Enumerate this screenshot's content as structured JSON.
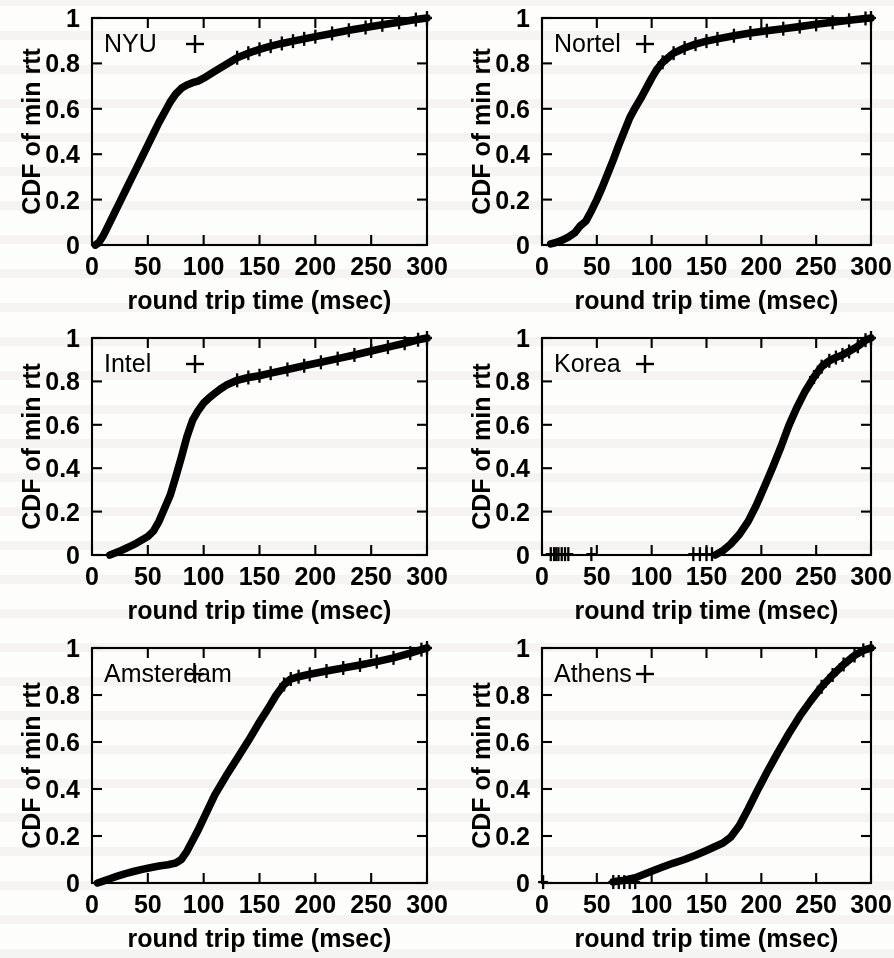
{
  "figure": {
    "panel_count": 6,
    "xlabel": "round trip time (msec)",
    "ylabel": "CDF of min rtt",
    "key_marker": "+"
  },
  "axes": {
    "x_ticks": [
      "0",
      "50",
      "100",
      "150",
      "200",
      "250",
      "300"
    ],
    "y_ticks": [
      "0",
      "0.2",
      "0.4",
      "0.6",
      "0.8",
      "1"
    ]
  },
  "chart_data": [
    {
      "type": "line",
      "title": "NYU",
      "xlabel": "round trip time (msec)",
      "ylabel": "CDF of min rtt",
      "xlim": [
        0,
        300
      ],
      "ylim": [
        0,
        1
      ],
      "grid": false,
      "legend": "NYU",
      "legend_position": "top-left-inside",
      "marker": "+",
      "x": [
        3,
        6,
        10,
        15,
        20,
        25,
        30,
        35,
        40,
        45,
        50,
        55,
        60,
        65,
        70,
        75,
        80,
        85,
        90,
        95,
        100,
        110,
        120,
        130,
        140,
        150,
        160,
        170,
        180,
        190,
        200,
        215,
        230,
        245,
        260,
        275,
        290,
        300
      ],
      "y": [
        0.0,
        0.01,
        0.04,
        0.09,
        0.14,
        0.19,
        0.24,
        0.29,
        0.34,
        0.39,
        0.44,
        0.49,
        0.54,
        0.585,
        0.63,
        0.665,
        0.69,
        0.705,
        0.715,
        0.722,
        0.735,
        0.765,
        0.795,
        0.825,
        0.845,
        0.862,
        0.876,
        0.888,
        0.898,
        0.908,
        0.918,
        0.932,
        0.946,
        0.958,
        0.97,
        0.981,
        0.993,
        1.0
      ]
    },
    {
      "type": "line",
      "title": "Nortel",
      "xlabel": "round trip time (msec)",
      "ylabel": "CDF of min rtt",
      "xlim": [
        0,
        300
      ],
      "ylim": [
        0,
        1
      ],
      "grid": false,
      "legend": "Nortel",
      "legend_position": "top-left-inside",
      "marker": "+",
      "x": [
        8,
        12,
        18,
        24,
        30,
        35,
        40,
        45,
        50,
        55,
        60,
        65,
        70,
        75,
        80,
        85,
        90,
        95,
        100,
        105,
        110,
        120,
        130,
        140,
        150,
        160,
        175,
        190,
        205,
        220,
        235,
        250,
        265,
        280,
        295,
        300
      ],
      "y": [
        0.005,
        0.01,
        0.02,
        0.035,
        0.055,
        0.085,
        0.105,
        0.15,
        0.2,
        0.255,
        0.315,
        0.375,
        0.44,
        0.5,
        0.56,
        0.605,
        0.645,
        0.69,
        0.735,
        0.775,
        0.805,
        0.845,
        0.868,
        0.885,
        0.898,
        0.908,
        0.922,
        0.934,
        0.944,
        0.953,
        0.962,
        0.972,
        0.981,
        0.99,
        0.998,
        1.0
      ]
    },
    {
      "type": "line",
      "title": "Intel",
      "xlabel": "round trip time (msec)",
      "ylabel": "CDF of min rtt",
      "xlim": [
        0,
        300
      ],
      "ylim": [
        0,
        1
      ],
      "grid": false,
      "legend": "Intel",
      "legend_position": "top-left-inside",
      "marker": "+",
      "x": [
        16,
        20,
        25,
        30,
        35,
        40,
        45,
        50,
        55,
        60,
        65,
        70,
        75,
        80,
        85,
        90,
        95,
        100,
        105,
        110,
        115,
        120,
        130,
        140,
        150,
        160,
        175,
        190,
        205,
        220,
        235,
        250,
        265,
        280,
        292,
        300
      ],
      "y": [
        0.0,
        0.008,
        0.018,
        0.03,
        0.042,
        0.055,
        0.07,
        0.085,
        0.11,
        0.155,
        0.215,
        0.275,
        0.36,
        0.45,
        0.545,
        0.62,
        0.665,
        0.7,
        0.725,
        0.745,
        0.765,
        0.782,
        0.805,
        0.818,
        0.826,
        0.838,
        0.855,
        0.872,
        0.888,
        0.905,
        0.922,
        0.94,
        0.958,
        0.976,
        0.992,
        1.0
      ]
    },
    {
      "type": "line",
      "title": "Korea",
      "xlabel": "round trip time (msec)",
      "ylabel": "CDF of min rtt",
      "xlim": [
        0,
        300
      ],
      "ylim": [
        0,
        1
      ],
      "grid": false,
      "legend": "Korea",
      "legend_position": "top-left-inside",
      "marker": "+",
      "sparse_low_markers": [
        8,
        11,
        13,
        15,
        18,
        21,
        24,
        45,
        138,
        144,
        150,
        155
      ],
      "x": [
        158,
        165,
        172,
        180,
        188,
        195,
        202,
        210,
        218,
        225,
        232,
        240,
        248,
        255,
        262,
        268,
        274,
        280,
        288,
        295,
        300
      ],
      "y": [
        0.0,
        0.02,
        0.05,
        0.095,
        0.155,
        0.225,
        0.305,
        0.4,
        0.5,
        0.595,
        0.675,
        0.755,
        0.82,
        0.868,
        0.895,
        0.91,
        0.922,
        0.938,
        0.962,
        0.99,
        1.0
      ]
    },
    {
      "type": "line",
      "title": "Amsterdam",
      "xlabel": "round trip time (msec)",
      "ylabel": "CDF of min rtt",
      "xlim": [
        0,
        300
      ],
      "ylim": [
        0,
        1
      ],
      "grid": false,
      "legend": "Amsterdam",
      "legend_position": "top-left-inside",
      "marker": "+",
      "x": [
        5,
        10,
        16,
        22,
        30,
        38,
        45,
        52,
        60,
        68,
        75,
        80,
        85,
        90,
        95,
        100,
        105,
        110,
        120,
        130,
        140,
        150,
        158,
        165,
        172,
        178,
        185,
        195,
        210,
        225,
        240,
        255,
        270,
        285,
        295,
        300
      ],
      "y": [
        0.0,
        0.008,
        0.018,
        0.028,
        0.04,
        0.05,
        0.058,
        0.065,
        0.072,
        0.078,
        0.085,
        0.1,
        0.135,
        0.18,
        0.225,
        0.275,
        0.325,
        0.375,
        0.455,
        0.53,
        0.605,
        0.685,
        0.745,
        0.8,
        0.845,
        0.868,
        0.878,
        0.888,
        0.902,
        0.915,
        0.928,
        0.942,
        0.958,
        0.978,
        0.993,
        1.0
      ]
    },
    {
      "type": "line",
      "title": "Athens",
      "xlabel": "round trip time (msec)",
      "ylabel": "CDF of min rtt",
      "xlim": [
        0,
        300
      ],
      "ylim": [
        0,
        1
      ],
      "grid": false,
      "legend": "Athens",
      "legend_position": "top-left-inside",
      "marker": "+",
      "sparse_low_markers": [
        1,
        65,
        70,
        75,
        80,
        85
      ],
      "x": [
        65,
        75,
        85,
        92,
        100,
        110,
        120,
        130,
        140,
        150,
        158,
        165,
        172,
        180,
        188,
        196,
        205,
        215,
        225,
        235,
        245,
        255,
        265,
        275,
        285,
        293,
        300
      ],
      "y": [
        0.005,
        0.012,
        0.022,
        0.035,
        0.05,
        0.068,
        0.085,
        0.1,
        0.118,
        0.138,
        0.155,
        0.17,
        0.195,
        0.245,
        0.315,
        0.39,
        0.47,
        0.555,
        0.635,
        0.71,
        0.775,
        0.835,
        0.885,
        0.93,
        0.968,
        0.99,
        1.0
      ]
    }
  ]
}
